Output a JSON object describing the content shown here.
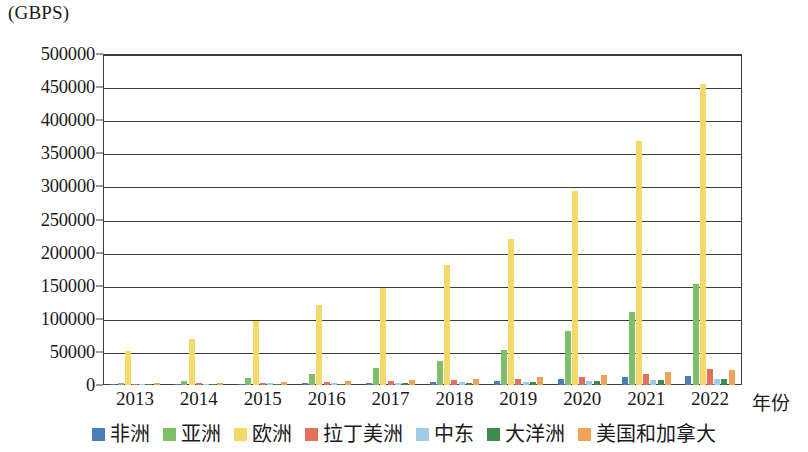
{
  "chart_data": {
    "type": "bar",
    "title": "",
    "unit_caption": "(GBPS)",
    "xlabel": "年份",
    "ylabel": "",
    "categories": [
      "2013",
      "2014",
      "2015",
      "2016",
      "2017",
      "2018",
      "2019",
      "2020",
      "2021",
      "2022"
    ],
    "ylim": [
      0,
      500000
    ],
    "y_ticks": [
      "0",
      "50000",
      "100000",
      "150000",
      "200000",
      "250000",
      "300000",
      "350000",
      "400000",
      "450000",
      "500000"
    ],
    "y_tick_values": [
      0,
      50000,
      100000,
      150000,
      200000,
      250000,
      300000,
      350000,
      400000,
      450000,
      500000
    ],
    "grid": true,
    "legend_position": "bottom",
    "series": [
      {
        "name": "非洲",
        "color": "#4a7ebb",
        "values": [
          800,
          1200,
          1800,
          2600,
          3600,
          4800,
          6500,
          9000,
          12000,
          14000
        ]
      },
      {
        "name": "亚洲",
        "color": "#7fbf6a",
        "values": [
          3500,
          5500,
          10000,
          17000,
          25000,
          36000,
          53000,
          81000,
          110000,
          153000
        ]
      },
      {
        "name": "欧洲",
        "color": "#f2d969",
        "values": [
          52000,
          70000,
          96000,
          121000,
          147000,
          181000,
          221000,
          293000,
          368000,
          455000
        ]
      },
      {
        "name": "拉丁美洲",
        "color": "#e2705a",
        "values": [
          2200,
          2800,
          3600,
          4600,
          6000,
          7500,
          9000,
          11500,
          17000,
          24000
        ]
      },
      {
        "name": "中东",
        "color": "#9fcbe8",
        "values": [
          1400,
          1800,
          2300,
          2900,
          3500,
          4200,
          5200,
          6500,
          8000,
          9500
        ]
      },
      {
        "name": "大洋洲",
        "color": "#3f8a4f",
        "values": [
          900,
          1200,
          1600,
          2100,
          2700,
          3400,
          4200,
          5500,
          7000,
          9000
        ]
      },
      {
        "name": "美国和加拿大",
        "color": "#f0a256",
        "values": [
          3000,
          3800,
          4800,
          6000,
          7500,
          9500,
          11500,
          14500,
          20000,
          23000
        ]
      }
    ]
  }
}
